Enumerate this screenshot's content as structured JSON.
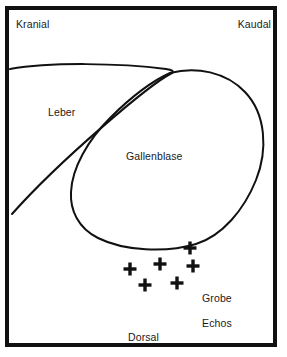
{
  "diagram": {
    "background_color": "#ffffff",
    "stroke_color": "#111111",
    "text_color": "#1a1a1a",
    "border": {
      "color": "#111111",
      "width_px": 4
    },
    "orientation_labels": {
      "top_left": "Kranial",
      "top_right": "Kaudal",
      "bottom_center": "Dorsal"
    },
    "anatomy_labels": {
      "liver": "Leber",
      "gallbladder": "Gallenblase"
    },
    "finding": {
      "line1": "Grobe",
      "line2": "Echos",
      "marker_glyph": "+",
      "marker_count": 6,
      "markers": [
        {
          "x": 190,
          "y": 248
        },
        {
          "x": 160,
          "y": 264
        },
        {
          "x": 193,
          "y": 266
        },
        {
          "x": 130,
          "y": 269
        },
        {
          "x": 177,
          "y": 283
        },
        {
          "x": 145,
          "y": 285
        }
      ]
    },
    "shapes": {
      "liver_outline": "M 10,69 C 50,62 120,63 166,69 C 172,70 174,71 172,73 C 150,84 60,160 12,214",
      "gallbladder_outline": "M 170,73 C 196,66 226,72 245,92 C 266,114 268,150 256,180 C 244,210 222,236 196,244 C 166,253 124,251 98,238 C 78,228 70,210 71,192 C 72,168 88,140 110,118 C 128,100 150,82 170,73 Z"
    }
  }
}
